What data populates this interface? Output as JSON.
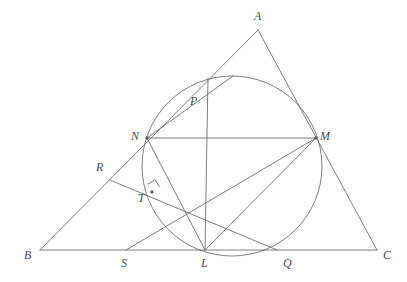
{
  "figure": {
    "type": "euclidean-geometry-diagram",
    "stroke_color": "#6e6e6e",
    "label_color": "#4a4a4a",
    "background_color": "#ffffff",
    "stroke_width": 0.9,
    "canvas": {
      "width": 407,
      "height": 282
    }
  },
  "points": [
    {
      "id": "A",
      "label": "A",
      "x": 258,
      "y": 30,
      "label_x": 254,
      "label_y": 10,
      "dot": false
    },
    {
      "id": "B",
      "label": "B",
      "x": 40,
      "y": 250,
      "label_x": 24,
      "label_y": 249,
      "dot": false
    },
    {
      "id": "C",
      "label": "C",
      "x": 377,
      "y": 250,
      "label_x": 383,
      "label_y": 249,
      "dot": false
    },
    {
      "id": "N",
      "label": "N",
      "x": 147,
      "y": 138,
      "label_x": 131,
      "label_y": 130,
      "dot": true
    },
    {
      "id": "M",
      "label": "M",
      "x": 316,
      "y": 138,
      "label_x": 320,
      "label_y": 130,
      "dot": true
    },
    {
      "id": "P",
      "label": "P",
      "x": 185,
      "y": 101,
      "label_x": 190,
      "label_y": 95,
      "dot": false
    },
    {
      "id": "R",
      "label": "R",
      "x": 110,
      "y": 180,
      "label_x": 96,
      "label_y": 161,
      "dot": false
    },
    {
      "id": "T",
      "label": "T",
      "x": 152,
      "y": 192,
      "label_x": 138,
      "label_y": 192,
      "dot": true
    },
    {
      "id": "S",
      "label": "S",
      "x": 126,
      "y": 250,
      "label_x": 121,
      "label_y": 257,
      "dot": false
    },
    {
      "id": "L",
      "label": "L",
      "x": 205,
      "y": 250,
      "label_x": 201,
      "label_y": 257,
      "dot": false
    },
    {
      "id": "Q",
      "label": "Q",
      "x": 277,
      "y": 250,
      "label_x": 283,
      "label_y": 257,
      "dot": false
    }
  ],
  "circle": {
    "cx": 232,
    "cy": 166,
    "r": 90,
    "label": "circle"
  },
  "segments": [
    {
      "id": "AB",
      "name": "side-ab",
      "x1": 258,
      "y1": 30,
      "x2": 40,
      "y2": 250
    },
    {
      "id": "AC",
      "name": "side-ac",
      "x1": 258,
      "y1": 30,
      "x2": 377,
      "y2": 250
    },
    {
      "id": "BC",
      "name": "side-bc",
      "x1": 40,
      "y1": 250,
      "x2": 377,
      "y2": 250
    },
    {
      "id": "NM",
      "name": "chord-nm",
      "x1": 147,
      "y1": 138,
      "x2": 316,
      "y2": 138
    },
    {
      "id": "NL",
      "name": "chord-nl",
      "x1": 147,
      "y1": 138,
      "x2": 205,
      "y2": 250
    },
    {
      "id": "ML",
      "name": "chord-ml",
      "x1": 316,
      "y1": 138,
      "x2": 205,
      "y2": 250
    },
    {
      "id": "MS",
      "name": "line-m-to-s",
      "x1": 316,
      "y1": 138,
      "x2": 126,
      "y2": 250
    },
    {
      "id": "RQ",
      "name": "line-r-to-q",
      "x1": 110,
      "y1": 180,
      "x2": 277,
      "y2": 250
    },
    {
      "id": "LA",
      "name": "line-l-through-p-to-circle",
      "x1": 205,
      "y1": 250,
      "x2": 208,
      "y2": 78
    },
    {
      "id": "NP",
      "name": "line-n-to-upper-circle",
      "x1": 147,
      "y1": 138,
      "x2": 233,
      "y2": 76
    }
  ],
  "right_angle": {
    "name": "right-angle-at-t",
    "vertex_x": 152,
    "vertex_y": 192,
    "size": 9,
    "note": "right angle marker at T"
  },
  "labels_note": "Italic serif capitals A B C N M P R T S L Q"
}
